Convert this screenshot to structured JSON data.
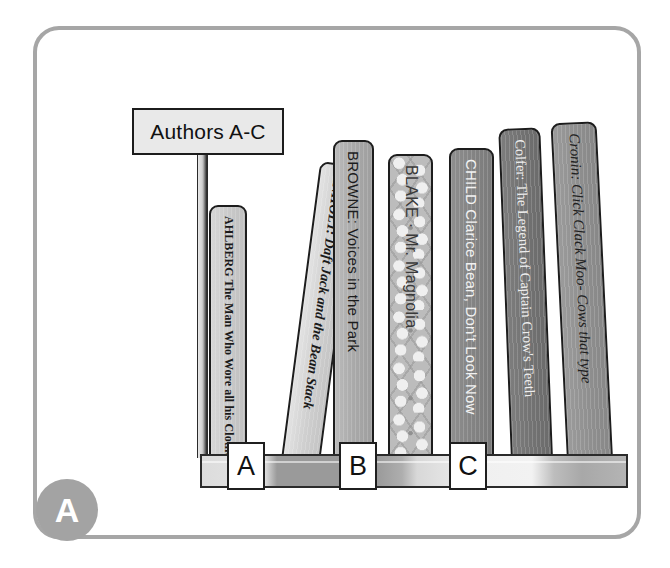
{
  "scene": {
    "title": "Library shelf illustration - Authors A-C",
    "frame_color": "#a6a6a6",
    "background_color": "#ffffff"
  },
  "sign": {
    "text": "Authors A-C",
    "board_fill": "#e9e9e9",
    "board_border": "#1c1c1c"
  },
  "badge": {
    "letter": "A",
    "fill": "#a3a3a3",
    "text_color": "#ffffff"
  },
  "shelf": {
    "tags": [
      {
        "letter": "A"
      },
      {
        "letter": "B"
      },
      {
        "letter": "C"
      }
    ]
  },
  "books": [
    {
      "id": "ahlberg",
      "author": "AHLBERG",
      "title": "The Man Who Wore all his Clothes",
      "spine_text": "AHLBERG The Man Who Wore all his Clothes",
      "spine_color": "#c9c9c9",
      "text_color": "#1a1a1a"
    },
    {
      "id": "anholt",
      "author": "ANHOLT",
      "title": "Daft Jack and the Bean Stack",
      "spine_text": "ANHOLT: Daft Jack and the Bean Stack",
      "spine_color": "#d0d0d0",
      "text_color": "#1a1a1a"
    },
    {
      "id": "browne",
      "author": "BROWNE",
      "title": "Voices in the Park",
      "spine_text": "BROWNE: Voices in the Park",
      "spine_color": "#a9a9a9",
      "text_color": "#1c1c1c"
    },
    {
      "id": "blake",
      "author": "BLAKE",
      "title": "Mr. Magnolia",
      "spine_text": "BLAKE · Mr. Magnolia",
      "spine_color": "#bcbcbc",
      "text_color": "#3a3a3a"
    },
    {
      "id": "child",
      "author": "CHILD",
      "title": "Clarice Bean, Don't Look Now",
      "spine_text": "CHILD Clarice Bean, Don't Look Now",
      "spine_color": "#848484",
      "text_color": "#f2f2f2"
    },
    {
      "id": "colfer",
      "author": "Colfer",
      "title": "The Legend of Captain Crow's Teeth",
      "spine_text": "Colfer: The Legend of Captain Crow's Teeth",
      "spine_color": "#737373",
      "text_color": "#ededed"
    },
    {
      "id": "cronin",
      "author": "Cronin",
      "title": "Click Clack Moo- Cows that type",
      "spine_text": "Cronin: Click Clack Moo- Cows that type",
      "spine_color": "#909090",
      "text_color": "#202020"
    }
  ]
}
